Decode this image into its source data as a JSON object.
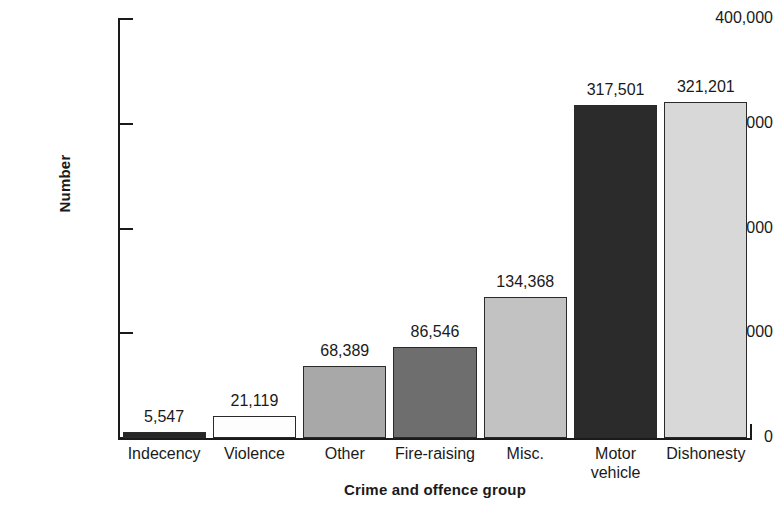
{
  "chart_data": {
    "type": "bar",
    "title": "",
    "xlabel": "Crime and offence group",
    "ylabel": "Number",
    "categories": [
      "Indecency",
      "Violence",
      "Other",
      "Fire-raising",
      "Misc.",
      "Motor\nvehicle",
      "Dishonesty"
    ],
    "values": [
      5547,
      21119,
      68389,
      86546,
      134368,
      317501,
      321201
    ],
    "value_labels": [
      "5,547",
      "21,119",
      "68,389",
      "86,546",
      "134,368",
      "317,501",
      "321,201"
    ],
    "bar_colors": [
      "#262626",
      "#fdfdfd",
      "#a8a8a8",
      "#6e6e6e",
      "#c2c2c2",
      "#2b2b2b",
      "#d8d8d8"
    ],
    "ylim": [
      0,
      400000
    ],
    "yticks": [
      0,
      100000,
      200000,
      300000,
      400000
    ],
    "ytick_labels": [
      "0",
      "100,000",
      "200,000",
      "300,000",
      "400,000"
    ],
    "grid": false,
    "legend": "none"
  }
}
